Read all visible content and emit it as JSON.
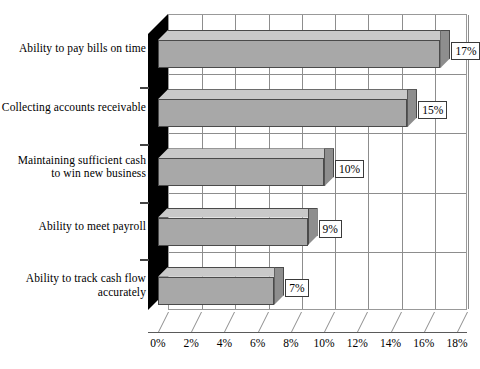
{
  "chart_data": {
    "type": "bar",
    "orientation": "horizontal",
    "title": "",
    "subtitle": "",
    "xlabel": "",
    "ylabel": "",
    "categories": [
      "Ability to pay bills on time",
      "Collecting accounts receivable",
      "Maintaining sufficient cash\nto win new business",
      "Ability to meet payroll",
      "Ability to track cash flow\naccurately"
    ],
    "values": [
      17,
      15,
      10,
      9,
      7
    ],
    "value_labels": [
      "17%",
      "15%",
      "10%",
      "9%",
      "7%"
    ],
    "xlim": [
      0,
      18
    ],
    "xticks": [
      0,
      2,
      4,
      6,
      8,
      10,
      12,
      14,
      16,
      18
    ],
    "xtick_labels": [
      "0%",
      "2%",
      "4%",
      "6%",
      "8%",
      "10%",
      "12%",
      "14%",
      "16%",
      "18%"
    ],
    "grid": "vertical",
    "legend": null,
    "style": "3d",
    "colors": {
      "bar_face": "#a8a8a8",
      "bar_top": "#c9c9c9",
      "bar_side": "#8e8e8e",
      "bar_edge": "#4a4a4a",
      "wall": "#000000",
      "plot_background": "#ffffff",
      "gridline": "#8d8d8d",
      "text": "#000000",
      "label_box_background": "#ffffff",
      "label_box_border": "#3a3a3a"
    }
  }
}
